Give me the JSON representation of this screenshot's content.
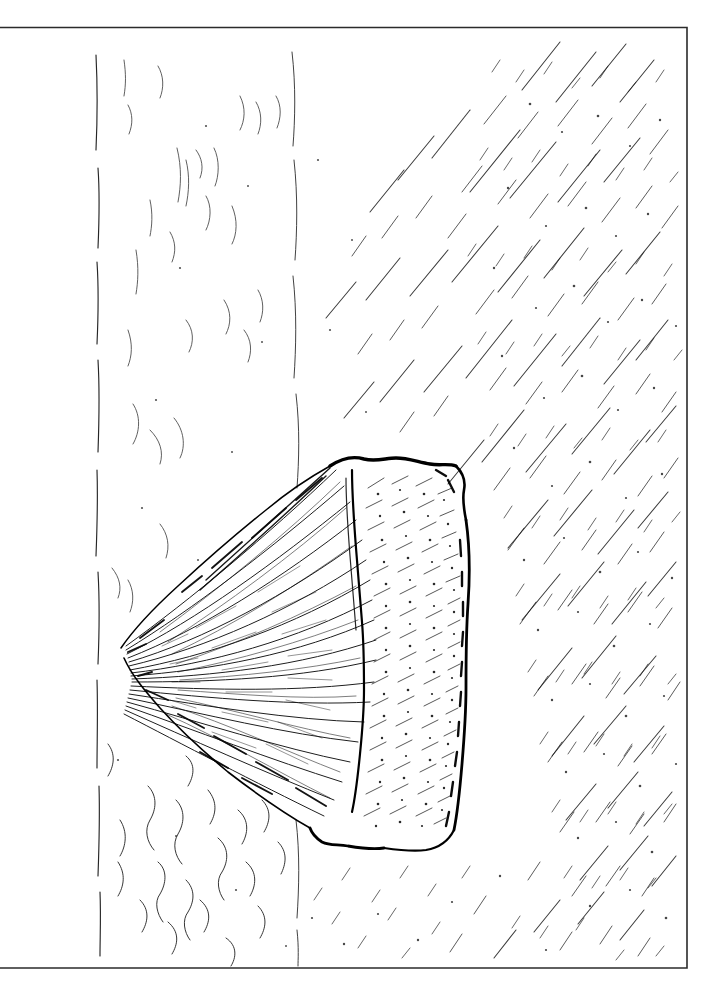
{
  "artwork": {
    "title": "Seashell line-art engraving",
    "subject": "seashell",
    "style": "black-and-white edge-traced pen-and-ink line art",
    "medium": "ink on white paper",
    "background_color": "#ffffff",
    "ink_color": "#000000",
    "canvas": {
      "width": 709,
      "height": 984
    },
    "frame": {
      "name": "border-frame",
      "color": "#2b2b2b",
      "stroke_width": 1.6,
      "left": 0,
      "top": 27,
      "right": 687,
      "bottom": 968
    },
    "subject_bounds": {
      "x": 118,
      "y": 452,
      "width": 356,
      "height": 402
    },
    "apex_point": {
      "x": 121,
      "y": 651
    },
    "regions": [
      {
        "name": "background-hatching-right",
        "description": "dense diagonal pen hatching, upper-right quadrant"
      },
      {
        "name": "background-hatching-left",
        "description": "sparse vertical and wavy strokes, left margin"
      },
      {
        "name": "sand-texture-bottom",
        "description": "wavy contour squiggles suggesting sand ripples"
      },
      {
        "name": "shell-body",
        "description": "fan-shaped bivalve shell with radiating ribs"
      },
      {
        "name": "shell-right-lobe",
        "description": "stippled right lobe with dark contour outline"
      }
    ],
    "vertical_guide_lines": [
      {
        "name": "guide-line-left",
        "x": 97
      },
      {
        "name": "guide-line-center",
        "x": 295
      }
    ]
  }
}
